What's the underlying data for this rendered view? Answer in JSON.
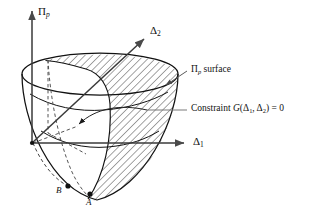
{
  "figure": {
    "type": "technical-diagram",
    "background_color": "#ffffff",
    "line_color": "#111111",
    "hatch_color": "#222222",
    "dashed_color": "#555555",
    "leader_color": "#666666"
  },
  "axes": {
    "vertical": {
      "name": "Pi-p axis",
      "symbol": "Π",
      "subscript": "p",
      "label": "Πp",
      "origin": [
        32,
        143
      ],
      "tip": [
        32,
        8
      ]
    },
    "horizontal": {
      "name": "Delta-1 axis",
      "symbol": "Δ",
      "subscript": "1",
      "label": "Δ1",
      "origin": [
        32,
        143
      ],
      "tip": [
        188,
        143
      ]
    },
    "oblique": {
      "name": "Delta-2 axis",
      "symbol": "Δ",
      "subscript": "2",
      "label": "Δ2",
      "origin": [
        32,
        143
      ],
      "tip": [
        147,
        36
      ]
    }
  },
  "annotations": {
    "surface": {
      "symbol": "Π",
      "subscript": "p",
      "text": " surface",
      "full": "Πp surface",
      "leader_from": [
        188,
        72
      ],
      "leader_to": [
        163,
        86
      ]
    },
    "constraint": {
      "prefix": "Constraint ",
      "function": "G",
      "open": "(",
      "arg1": "Δ",
      "arg1_sub": "1",
      "comma": ", ",
      "arg2": "Δ",
      "arg2_sub": "2",
      "close": ")",
      "equals": " = 0",
      "full": "Constraint G(Δ1, Δ2) = 0",
      "leader_from": [
        188,
        110
      ],
      "leader_to": [
        147,
        110
      ],
      "curve_arrow_to": [
        74,
        127
      ]
    }
  },
  "points": [
    {
      "label": "A",
      "marker": "filled-dot",
      "x": 90,
      "y": 194,
      "label_x": 86,
      "label_y": 204
    },
    {
      "label": "B",
      "marker": "filled-dot",
      "x": 68,
      "y": 186,
      "label_x": 56,
      "label_y": 192
    }
  ],
  "geometry": {
    "rim_ellipse": {
      "cx": 100,
      "cy": 74,
      "rx": 78,
      "ry": 21
    },
    "bowl_bottom": [
      97,
      200
    ],
    "hatch_angle_deg": 45,
    "hatch_spacing_px": 4
  }
}
